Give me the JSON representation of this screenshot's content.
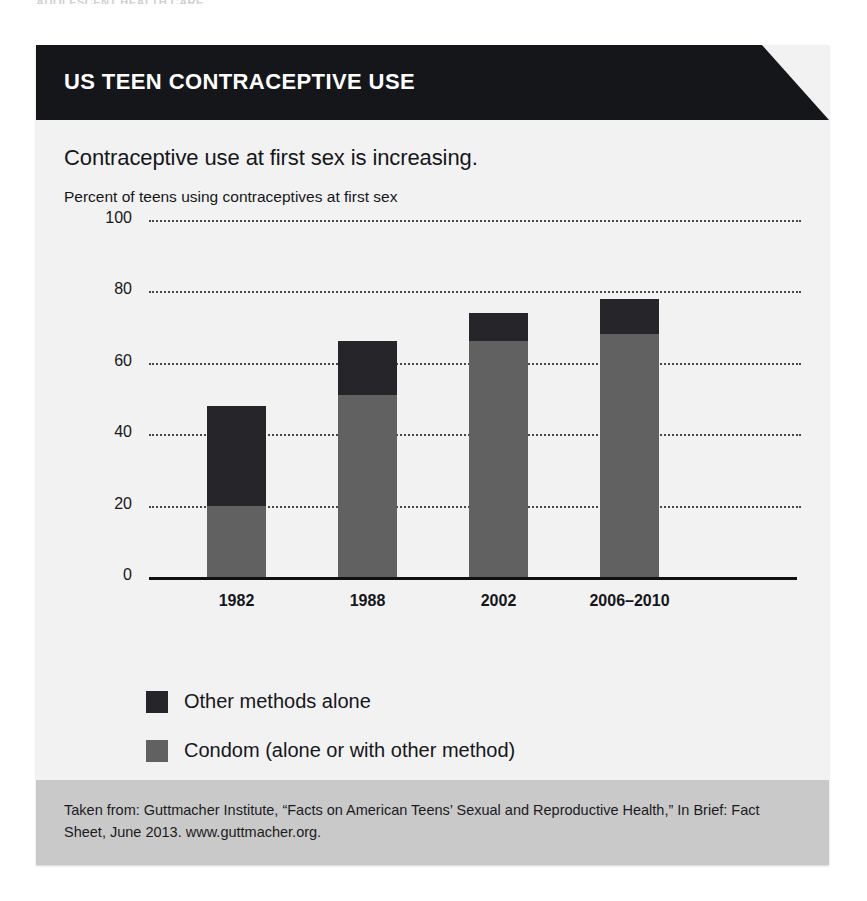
{
  "running_head": "ADOLESCENT HEALTH CARE",
  "banner": {
    "title": "US TEEN CONTRACEPTIVE USE"
  },
  "chart": {
    "headline": "Contraceptive use at first sex is increasing.",
    "subtitle": "Percent of teens using contraceptives at first sex"
  },
  "legend": {
    "items": [
      {
        "label": "Other methods alone",
        "color": "#26262a",
        "swatch_name": "legend-swatch-other-methods"
      },
      {
        "label": "Condom (alone or with other method)",
        "color": "#616161",
        "swatch_name": "legend-swatch-condom"
      }
    ]
  },
  "footer": {
    "text": "Taken from: Guttmacher Institute, “Facts on American Teens’ Sexual and Reproductive Health,” In Brief: Fact Sheet, June 2013. www.guttmacher.org."
  },
  "chart_data": {
    "type": "bar",
    "stacked": true,
    "title": "Contraceptive use at first sex is increasing.",
    "subtitle": "Percent of teens using contraceptives at first sex",
    "xlabel": "",
    "ylabel": "Percent of teens using contraceptives at first sex",
    "categories": [
      "1982",
      "1988",
      "2002",
      "2006–2010"
    ],
    "ylim": [
      0,
      100
    ],
    "yticks": [
      0,
      20,
      40,
      60,
      80,
      100
    ],
    "grid": "horizontal-dotted",
    "legend_position": "below-axis-left",
    "series": [
      {
        "name": "Condom (alone or with other method)",
        "color": "#616161",
        "values": [
          20,
          51,
          66,
          68
        ]
      },
      {
        "name": "Other methods alone",
        "color": "#26262a",
        "values": [
          28,
          15,
          8,
          10
        ]
      }
    ],
    "totals": [
      48,
      66,
      74,
      78
    ],
    "source": "Guttmacher Institute, “Facts on American Teens’ Sexual and Reproductive Health,” In Brief: Fact Sheet, June 2013. www.guttmacher.org."
  }
}
